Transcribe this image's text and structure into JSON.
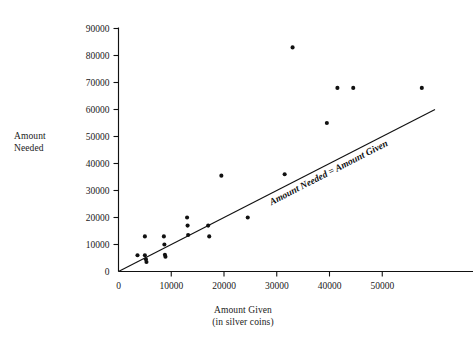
{
  "chart_data": {
    "type": "scatter",
    "title": "",
    "xlabel": "Amount Given",
    "xlabel_sub": "(in silver coins)",
    "ylabel": "Amount\nNeeded",
    "xlim": [
      0,
      60000
    ],
    "ylim": [
      0,
      90000
    ],
    "xticks": [
      0,
      10000,
      20000,
      30000,
      40000,
      50000
    ],
    "yticks": [
      0,
      10000,
      20000,
      30000,
      40000,
      50000,
      60000,
      70000,
      80000,
      90000
    ],
    "xticklabels": [
      "0",
      "10000",
      "20000",
      "30000",
      "40000",
      "50000"
    ],
    "yticklabels": [
      "0",
      "10000",
      "20000",
      "30000",
      "40000",
      "50000",
      "60000",
      "70000",
      "80000",
      "90000"
    ],
    "grid": false,
    "legend": false,
    "marker": "filled-circle",
    "marker_color": "#111111",
    "series": [
      {
        "name": "Households",
        "points": [
          [
            3600,
            6000
          ],
          [
            5000,
            13000
          ],
          [
            5000,
            6000
          ],
          [
            5200,
            4500
          ],
          [
            5300,
            3500
          ],
          [
            8600,
            13000
          ],
          [
            8700,
            10000
          ],
          [
            8800,
            6200
          ],
          [
            8900,
            5500
          ],
          [
            13000,
            20000
          ],
          [
            13100,
            17000
          ],
          [
            13200,
            13500
          ],
          [
            17000,
            17000
          ],
          [
            17200,
            13000
          ],
          [
            19500,
            35500
          ],
          [
            24500,
            20000
          ],
          [
            31500,
            36000
          ],
          [
            33000,
            83000
          ],
          [
            39500,
            55000
          ],
          [
            41500,
            68000
          ],
          [
            44500,
            68000
          ],
          [
            57500,
            68000
          ]
        ]
      }
    ],
    "reference_line": {
      "label": "Amount Needed = Amount Given",
      "slope": 1,
      "intercept": 0,
      "from": [
        0,
        0
      ],
      "to": [
        60000,
        60000
      ],
      "color": "#111111"
    }
  }
}
